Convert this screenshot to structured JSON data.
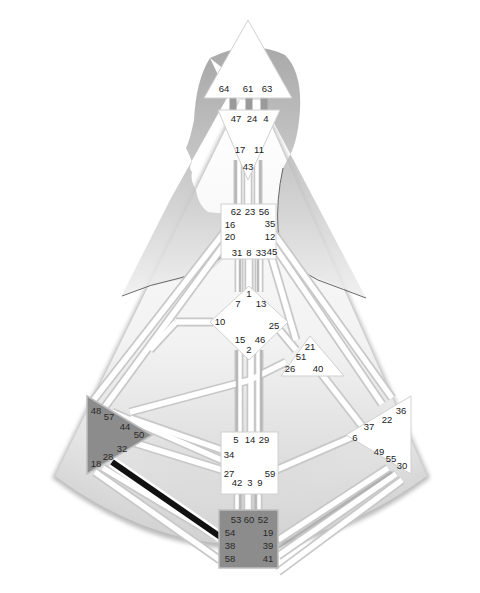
{
  "diagram": {
    "type": "human-design-bodygraph",
    "colors": {
      "background": "#ffffff",
      "body_fill": "#d9d9d9",
      "body_fill_light": "#f4f4f4",
      "silhouette": "#b8b8b8",
      "center_open": "#ffffff",
      "center_defined": "#8c8c8c",
      "center_border": "#bfbfbf",
      "channel_open": "#ffffff",
      "channel_outline": "#c8c8c8",
      "channel_defined_gray": "#a9a9a9",
      "channel_defined_black": "#111111",
      "text": "#222222"
    },
    "centers": {
      "head": {
        "label": "Head",
        "defined": false,
        "gates": [
          "64",
          "61",
          "63"
        ]
      },
      "ajna": {
        "label": "Ajna",
        "defined": false,
        "gates": [
          "47",
          "24",
          "4",
          "17",
          "11",
          "43"
        ]
      },
      "throat": {
        "label": "Throat",
        "defined": false,
        "gates": [
          "62",
          "23",
          "56",
          "16",
          "35",
          "20",
          "12",
          "31",
          "8",
          "33",
          "45"
        ]
      },
      "g": {
        "label": "G",
        "defined": false,
        "gates": [
          "1",
          "7",
          "13",
          "10",
          "25",
          "15",
          "46",
          "2"
        ]
      },
      "heart": {
        "label": "Heart",
        "defined": false,
        "gates": [
          "21",
          "51",
          "26",
          "40"
        ]
      },
      "sacral": {
        "label": "Sacral",
        "defined": false,
        "gates": [
          "5",
          "14",
          "29",
          "34",
          "27",
          "59",
          "42",
          "3",
          "9"
        ]
      },
      "spleen": {
        "label": "Spleen",
        "defined": true,
        "gates": [
          "48",
          "57",
          "44",
          "50",
          "32",
          "28",
          "18"
        ]
      },
      "solar_plexus": {
        "label": "Solar Plexus",
        "defined": false,
        "gates": [
          "36",
          "22",
          "37",
          "6",
          "49",
          "55",
          "30"
        ]
      },
      "root": {
        "label": "Root",
        "defined": true,
        "gates": [
          "53",
          "60",
          "52",
          "54",
          "19",
          "38",
          "39",
          "58",
          "41"
        ]
      }
    },
    "highlighted_channel": {
      "from_gate": "28",
      "to_gate": "38",
      "color": "#111111"
    }
  }
}
